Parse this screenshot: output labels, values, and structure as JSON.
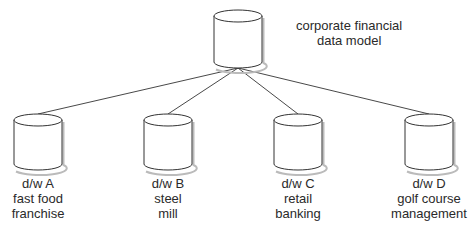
{
  "diagram": {
    "root": {
      "label_lines": [
        "corporate financial",
        "data model"
      ],
      "shape": "cylinder-icon"
    },
    "children": [
      {
        "label_lines": [
          "d/w A",
          "fast food",
          "franchise"
        ],
        "shape": "cylinder-icon"
      },
      {
        "label_lines": [
          "d/w B",
          "steel",
          "mill"
        ],
        "shape": "cylinder-icon"
      },
      {
        "label_lines": [
          "d/w C",
          "retail",
          "banking"
        ],
        "shape": "cylinder-icon"
      },
      {
        "label_lines": [
          "d/w D",
          "golf course",
          "management"
        ],
        "shape": "cylinder-icon"
      }
    ],
    "edges": [
      {
        "from": "root",
        "to": "d/w A"
      },
      {
        "from": "root",
        "to": "d/w B"
      },
      {
        "from": "root",
        "to": "d/w C"
      },
      {
        "from": "root",
        "to": "d/w D"
      }
    ],
    "colors": {
      "stroke": "#333333",
      "fill": "#ffffff",
      "shadow": "#bbbbbb",
      "text": "#2a2a2a"
    }
  }
}
